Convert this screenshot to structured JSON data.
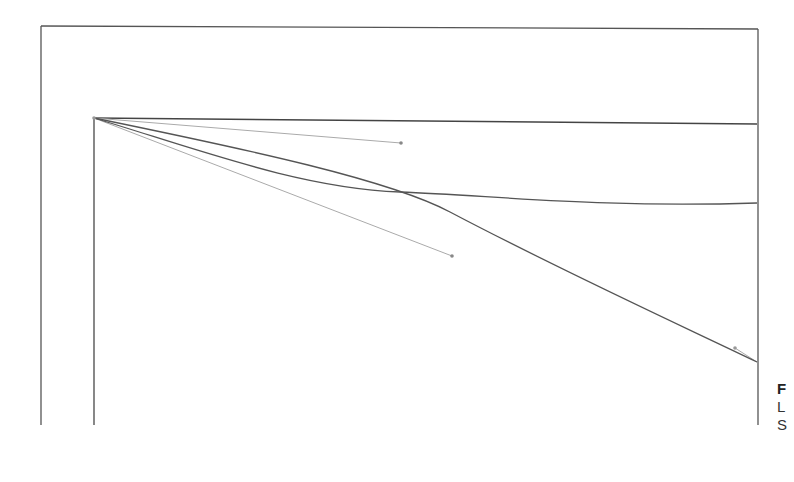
{
  "diagram": {
    "type": "bezier-curve-figure",
    "colors": {
      "frame": "#555555",
      "axis": "#444444",
      "curve": "#555555",
      "handle": "#aaaaaa",
      "handle_point": "#888888",
      "background": "#ffffff"
    },
    "frame": {
      "x1": 41,
      "y1": 26,
      "x2": 758,
      "y2": 425
    },
    "axes": {
      "origin": {
        "x": 94,
        "y": 118
      },
      "horizontal_end": {
        "x": 757,
        "y": 124
      },
      "vertical_end": {
        "x": 94,
        "y": 425
      }
    },
    "curves": [
      {
        "name": "flattening-curve",
        "path": "M94,118 C200,150 300,190 400,192 C500,196 600,208 757,203"
      },
      {
        "name": "steep-curve",
        "path": "M94,118 C250,150 400,180 450,212 C560,270 680,325 757,362"
      }
    ],
    "handles": [
      {
        "name": "handle-1",
        "from": {
          "x": 94,
          "y": 118
        },
        "to": {
          "x": 401,
          "y": 143
        }
      },
      {
        "name": "handle-2",
        "from": {
          "x": 94,
          "y": 118
        },
        "to": {
          "x": 452,
          "y": 256
        }
      },
      {
        "name": "handle-3",
        "from": {
          "x": 757,
          "y": 362
        },
        "to": {
          "x": 735,
          "y": 348
        }
      }
    ]
  },
  "caption": {
    "title": "F",
    "lines": [
      "L",
      "S"
    ]
  }
}
